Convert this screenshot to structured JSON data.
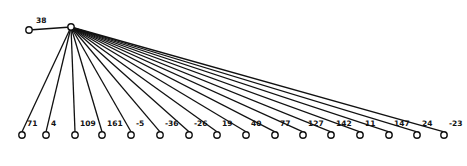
{
  "diagram": {
    "type": "tree",
    "root": {
      "x": 71,
      "y": 27
    },
    "left_child": {
      "x": 29,
      "y": 30,
      "label": "38",
      "label_x": 36,
      "label_y": 23
    },
    "leaf_y": 135,
    "leaves": [
      {
        "x": 22,
        "label": "71"
      },
      {
        "x": 46,
        "label": "4"
      },
      {
        "x": 75,
        "label": "109"
      },
      {
        "x": 102,
        "label": "161"
      },
      {
        "x": 131,
        "label": "-5"
      },
      {
        "x": 160,
        "label": "-36"
      },
      {
        "x": 189,
        "label": "-26"
      },
      {
        "x": 217,
        "label": "19"
      },
      {
        "x": 246,
        "label": "40"
      },
      {
        "x": 275,
        "label": "77"
      },
      {
        "x": 303,
        "label": "127"
      },
      {
        "x": 331,
        "label": "142"
      },
      {
        "x": 360,
        "label": "11"
      },
      {
        "x": 389,
        "label": "147"
      },
      {
        "x": 417,
        "label": "24"
      },
      {
        "x": 444,
        "label": "-23"
      }
    ],
    "colors": {
      "line": "#111111",
      "node_fill": "#ffffff",
      "background": "#ffffff"
    }
  }
}
